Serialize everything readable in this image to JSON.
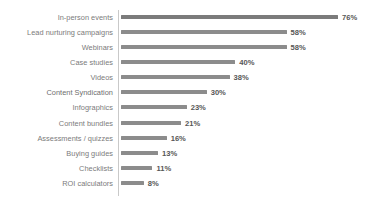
{
  "chart_data": {
    "type": "bar",
    "orientation": "horizontal",
    "title": "",
    "subtitle": "",
    "xlabel": "",
    "ylabel": "",
    "grid": false,
    "legend": null,
    "legend_position": "none",
    "xlim": [
      0,
      76
    ],
    "value_suffix": "%",
    "bar_color": "#8c8c8c",
    "axis_color": "#c9c9c9",
    "label_color": "#7b7b7b",
    "value_color": "#575757",
    "background": "#ffffff",
    "categories": [
      "In-person events",
      "Lead nurturing campaigns",
      "Webinars",
      "Case studies",
      "Videos",
      "Content Syndication",
      "Infographics",
      "Content bundles",
      "Assessments / quizzes",
      "Buying guides",
      "Checklists",
      "ROI calculators"
    ],
    "values": [
      76,
      58,
      58,
      40,
      38,
      30,
      23,
      21,
      16,
      13,
      11,
      8
    ],
    "value_labels": [
      "76%",
      "58%",
      "58%",
      "40%",
      "38%",
      "30%",
      "23%",
      "21%",
      "16%",
      "13%",
      "11%",
      "8%"
    ]
  }
}
